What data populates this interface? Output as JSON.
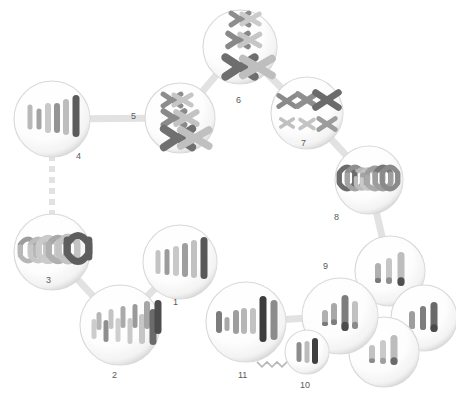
{
  "diagram": {
    "background_color": "#ffffff",
    "cell_fill": "#fbfbfb",
    "cell_edge_color": "#d8d8d8",
    "label_color": "#5a5a5a",
    "connector_color": "#e2e2e2",
    "chromosome_shades": [
      "#c9c9c9",
      "#b4b4b4",
      "#9e9e9e",
      "#8a8a8a",
      "#6f6f6f",
      "#4f4f4f"
    ]
  },
  "labels": [
    {
      "id": "label-1",
      "text": "1",
      "x": 173,
      "y": 298
    },
    {
      "id": "label-2",
      "text": "2",
      "x": 112,
      "y": 371
    },
    {
      "id": "label-3",
      "text": "3",
      "x": 46,
      "y": 276
    },
    {
      "id": "label-4",
      "text": "4",
      "x": 76,
      "y": 152
    },
    {
      "id": "label-5",
      "text": "5",
      "x": 131,
      "y": 112
    },
    {
      "id": "label-6",
      "text": "6",
      "x": 236,
      "y": 96
    },
    {
      "id": "label-7",
      "text": "7",
      "x": 301,
      "y": 139
    },
    {
      "id": "label-8",
      "text": "8",
      "x": 334,
      "y": 213
    },
    {
      "id": "label-9",
      "text": "9",
      "x": 323,
      "y": 262
    },
    {
      "id": "label-10",
      "text": "10",
      "x": 300,
      "y": 381
    },
    {
      "id": "label-11",
      "text": "11",
      "x": 238,
      "y": 371
    }
  ],
  "cells": [
    {
      "id": "cell-4",
      "name": "cell-4-interphase",
      "label": "4",
      "cx": 52,
      "cy": 119,
      "r": 38,
      "stage": "interphase-chromosomes",
      "chromosomes": [
        {
          "x": -22,
          "y": -2,
          "w": 5,
          "h": 25,
          "shade": "#b9b9b9"
        },
        {
          "x": -13,
          "y": 0,
          "w": 5,
          "h": 21,
          "shade": "#a3a3a3"
        },
        {
          "x": -4,
          "y": -1,
          "w": 6,
          "h": 30,
          "shade": "#c9c9c9"
        },
        {
          "x": 5,
          "y": -1,
          "w": 6,
          "h": 30,
          "shade": "#949494"
        },
        {
          "x": 14,
          "y": -2,
          "w": 6,
          "h": 36,
          "shade": "#bdbdbd"
        },
        {
          "x": 24,
          "y": -3,
          "w": 7,
          "h": 42,
          "shade": "#5b5b5b"
        }
      ]
    },
    {
      "id": "cell-3",
      "name": "cell-3-anaphase",
      "label": "3",
      "cx": 52,
      "cy": 252,
      "r": 38,
      "stage": "anaphase-v-shapes",
      "chromosomes": [
        {
          "x": -24,
          "y": -12,
          "w": 5,
          "h": 13,
          "shade": "#9d9d9d",
          "shape": "arch-up"
        },
        {
          "x": -14,
          "y": -12,
          "w": 5,
          "h": 13,
          "shade": "#bdbdbd",
          "shape": "arch-up"
        },
        {
          "x": -4,
          "y": -13,
          "w": 6,
          "h": 16,
          "shade": "#cacaca",
          "shape": "arch-up"
        },
        {
          "x": 6,
          "y": -13,
          "w": 6,
          "h": 16,
          "shade": "#a8a8a8",
          "shape": "arch-up"
        },
        {
          "x": 16,
          "y": -14,
          "w": 6,
          "h": 18,
          "shade": "#c3c3c3",
          "shape": "arch-up"
        },
        {
          "x": 26,
          "y": -15,
          "w": 7,
          "h": 20,
          "shade": "#5e5e5e",
          "shape": "arch-up"
        },
        {
          "x": -24,
          "y": 8,
          "w": 5,
          "h": 13,
          "shade": "#b7b7b7",
          "shape": "arch-down"
        },
        {
          "x": -14,
          "y": 8,
          "w": 5,
          "h": 13,
          "shade": "#c7c7c7",
          "shape": "arch-down"
        },
        {
          "x": -4,
          "y": 8,
          "w": 6,
          "h": 16,
          "shade": "#cacaca",
          "shape": "arch-down"
        },
        {
          "x": 6,
          "y": 8,
          "w": 6,
          "h": 16,
          "shade": "#b0b0b0",
          "shape": "arch-down"
        },
        {
          "x": 16,
          "y": 8,
          "w": 6,
          "h": 18,
          "shade": "#c3c3c3",
          "shape": "arch-down"
        },
        {
          "x": 26,
          "y": 8,
          "w": 7,
          "h": 20,
          "shade": "#5e5e5e",
          "shape": "arch-down"
        }
      ]
    },
    {
      "id": "cell-2",
      "name": "cell-2-prophase",
      "label": "2",
      "cx": 120,
      "cy": 325,
      "r": 40,
      "stage": "condensing-chromatin",
      "chromosomes": [
        {
          "x": -26,
          "y": 4,
          "w": 5,
          "h": 20,
          "shade": "#cccccc"
        },
        {
          "x": -21,
          "y": -4,
          "w": 5,
          "h": 18,
          "shade": "#b6b6b6"
        },
        {
          "x": -14,
          "y": 6,
          "w": 5,
          "h": 22,
          "shade": "#8f8f8f"
        },
        {
          "x": -9,
          "y": -6,
          "w": 5,
          "h": 20,
          "shade": "#c4c4c4"
        },
        {
          "x": -2,
          "y": 5,
          "w": 5,
          "h": 24,
          "shade": "#cfcfcf"
        },
        {
          "x": 3,
          "y": -8,
          "w": 5,
          "h": 22,
          "shade": "#aaaaaa"
        },
        {
          "x": 10,
          "y": 6,
          "w": 5,
          "h": 26,
          "shade": "#c9c9c9"
        },
        {
          "x": 15,
          "y": -9,
          "w": 5,
          "h": 24,
          "shade": "#9a9a9a"
        },
        {
          "x": 22,
          "y": 4,
          "w": 6,
          "h": 30,
          "shade": "#c6c6c6"
        },
        {
          "x": 27,
          "y": -10,
          "w": 6,
          "h": 28,
          "shade": "#a6a6a6"
        },
        {
          "x": 33,
          "y": 2,
          "w": 7,
          "h": 36,
          "shade": "#6b6b6b"
        },
        {
          "x": 38,
          "y": -8,
          "w": 7,
          "h": 34,
          "shade": "#4d4d4d"
        }
      ]
    },
    {
      "id": "cell-1",
      "name": "cell-1-g1-cell",
      "label": "1",
      "cx": 180,
      "cy": 262,
      "r": 37,
      "stage": "unreplicated-chromosomes",
      "chromosomes": [
        {
          "x": -22,
          "y": 0,
          "w": 5,
          "h": 24,
          "shade": "#c3c3c3"
        },
        {
          "x": -13,
          "y": 0,
          "w": 5,
          "h": 26,
          "shade": "#9b9b9b"
        },
        {
          "x": -4,
          "y": -1,
          "w": 6,
          "h": 30,
          "shade": "#c8c8c8"
        },
        {
          "x": 5,
          "y": -2,
          "w": 6,
          "h": 34,
          "shade": "#9e9e9e"
        },
        {
          "x": 14,
          "y": -3,
          "w": 6,
          "h": 38,
          "shade": "#c1c1c1"
        },
        {
          "x": 24,
          "y": -4,
          "w": 7,
          "h": 42,
          "shade": "#585858"
        }
      ]
    },
    {
      "id": "cell-5",
      "name": "cell-5-prophase-i",
      "label": "5",
      "cx": 180,
      "cy": 118,
      "r": 35,
      "stage": "tetrads-crossing-over",
      "tetrads": [
        {
          "x": -8,
          "y": -18,
          "size": 17,
          "shade_a": "#8d8d8d",
          "shade_b": "#c6c6c6"
        },
        {
          "x": -6,
          "y": 0,
          "size": 20,
          "shade_a": "#8a8a8a",
          "shade_b": "#c3c3c3"
        },
        {
          "x": -2,
          "y": 20,
          "size": 27,
          "shade_a": "#707070",
          "shade_b": "#c0c0c0"
        }
      ]
    },
    {
      "id": "cell-6",
      "name": "cell-6-metaphase-i",
      "label": "6",
      "cx": 240,
      "cy": 47,
      "r": 37,
      "stage": "metaphase-plate-alignment",
      "tetrads": [
        {
          "x": 0,
          "y": -28,
          "size": 17,
          "shade_a": "#8d8d8d",
          "shade_b": "#cbcbcb"
        },
        {
          "x": -2,
          "y": -7,
          "size": 19,
          "shade_a": "#888888",
          "shade_b": "#c6c6c6"
        },
        {
          "x": 0,
          "y": 20,
          "size": 28,
          "shade_a": "#6e6e6e",
          "shade_b": "#bebebe"
        }
      ]
    },
    {
      "id": "cell-7",
      "name": "cell-7-anaphase-i",
      "label": "7",
      "cx": 307,
      "cy": 113,
      "r": 36,
      "stage": "homologs-separating",
      "tetrads": [
        {
          "x": -20,
          "y": -12,
          "size": 16,
          "shade_a": "#8a8a8a",
          "shade_b": "#8a8a8a"
        },
        {
          "x": 0,
          "y": -13,
          "size": 18,
          "shade_a": "#8f8f8f",
          "shade_b": "#8f8f8f"
        },
        {
          "x": 20,
          "y": -13,
          "size": 22,
          "shade_a": "#6b6b6b",
          "shade_b": "#6b6b6b"
        },
        {
          "x": -20,
          "y": 10,
          "size": 12,
          "shade_a": "#c0c0c0",
          "shade_b": "#c0c0c0"
        },
        {
          "x": 0,
          "y": 11,
          "size": 13,
          "shade_a": "#c4c4c4",
          "shade_b": "#c4c4c4"
        },
        {
          "x": 20,
          "y": 11,
          "size": 16,
          "shade_a": "#9c9c9c",
          "shade_b": "#9c9c9c"
        }
      ]
    },
    {
      "id": "cell-8",
      "name": "cell-8-anaphase-ii",
      "label": "8",
      "cx": 369,
      "cy": 180,
      "r": 34,
      "stage": "sister-chromatids-separating",
      "chromosomes": [
        {
          "x": -22,
          "y": -12,
          "w": 5,
          "h": 14,
          "shade": "#6c6c6c",
          "shape": "arch-up"
        },
        {
          "x": -14,
          "y": -12,
          "w": 5,
          "h": 13,
          "shade": "#8f8f8f",
          "shape": "arch-up"
        },
        {
          "x": -7,
          "y": -10,
          "w": 4,
          "h": 10,
          "shade": "#b6b6b6",
          "shape": "arch-up"
        },
        {
          "x": -1,
          "y": -10,
          "w": 4,
          "h": 9,
          "shade": "#c4c4c4",
          "shape": "arch-up"
        },
        {
          "x": 6,
          "y": -11,
          "w": 5,
          "h": 11,
          "shade": "#9d9d9d",
          "shape": "arch-up"
        },
        {
          "x": 14,
          "y": -12,
          "w": 5,
          "h": 14,
          "shade": "#777777",
          "shape": "arch-up"
        },
        {
          "x": 21,
          "y": -12,
          "w": 5,
          "h": 14,
          "shade": "#8a8a8a",
          "shape": "arch-up"
        },
        {
          "x": -22,
          "y": 8,
          "w": 5,
          "h": 14,
          "shade": "#6c6c6c",
          "shape": "arch-down"
        },
        {
          "x": -14,
          "y": 8,
          "w": 5,
          "h": 13,
          "shade": "#a3a3a3",
          "shape": "arch-down"
        },
        {
          "x": -7,
          "y": 8,
          "w": 4,
          "h": 10,
          "shade": "#bcbcbc",
          "shape": "arch-down"
        },
        {
          "x": -1,
          "y": 8,
          "w": 4,
          "h": 9,
          "shade": "#c8c8c8",
          "shape": "arch-down"
        },
        {
          "x": 6,
          "y": 8,
          "w": 5,
          "h": 11,
          "shade": "#a9a9a9",
          "shape": "arch-down"
        },
        {
          "x": 14,
          "y": 8,
          "w": 5,
          "h": 14,
          "shade": "#9d9d9d",
          "shape": "arch-down"
        },
        {
          "x": 21,
          "y": 8,
          "w": 5,
          "h": 14,
          "shade": "#8a8a8a",
          "shape": "arch-down"
        }
      ]
    },
    {
      "id": "cell-9",
      "name": "cell-9-haploid-gamete",
      "label": "9",
      "cx": 390,
      "cy": 271,
      "r": 35,
      "stage": "haploid-cell",
      "chromosomes": [
        {
          "x": -12,
          "y": 2,
          "w": 6,
          "h": 20,
          "shade": "#b0b0b0",
          "tip": "#7a7a7a"
        },
        {
          "x": -1,
          "y": 0,
          "w": 6,
          "h": 26,
          "shade": "#c6c6c6",
          "tip": "#8f8f8f"
        },
        {
          "x": 11,
          "y": -2,
          "w": 7,
          "h": 34,
          "shade": "#bdbdbd",
          "tip": "#4f4f4f"
        }
      ]
    },
    {
      "id": "cell-9b",
      "name": "haploid-gamete-right",
      "label": "",
      "cx": 424,
      "cy": 318,
      "r": 33,
      "stage": "haploid-cell",
      "chromosomes": [
        {
          "x": -12,
          "y": 2,
          "w": 6,
          "h": 18,
          "shade": "#9e9e9e",
          "tip": "#9e9e9e"
        },
        {
          "x": -1,
          "y": 0,
          "w": 6,
          "h": 24,
          "shade": "#7e7e7e",
          "tip": "#7e7e7e"
        },
        {
          "x": 10,
          "y": -1,
          "w": 7,
          "h": 30,
          "shade": "#6a6a6a",
          "tip": "#4a4a4a"
        }
      ]
    },
    {
      "id": "cell-9c",
      "name": "haploid-gamete-bottom",
      "label": "",
      "cx": 384,
      "cy": 352,
      "r": 35,
      "stage": "haploid-cell",
      "chromosomes": [
        {
          "x": -12,
          "y": 2,
          "w": 6,
          "h": 18,
          "shade": "#c2c2c2",
          "tip": "#8d8d8d"
        },
        {
          "x": -1,
          "y": 0,
          "w": 6,
          "h": 24,
          "shade": "#cacaca",
          "tip": "#a0a0a0"
        },
        {
          "x": 10,
          "y": -2,
          "w": 7,
          "h": 30,
          "shade": "#bcbcbc",
          "tip": "#6a6a6a"
        }
      ]
    },
    {
      "id": "cell-9d",
      "name": "haploid-gamete-center",
      "label": "",
      "cx": 340,
      "cy": 316,
      "r": 38,
      "stage": "haploid-cell",
      "chromosomes": [
        {
          "x": -15,
          "y": 2,
          "w": 6,
          "h": 16,
          "shade": "#b0b0b0",
          "tip": "#7a7a7a"
        },
        {
          "x": -6,
          "y": -2,
          "w": 6,
          "h": 22,
          "shade": "#a8a8a8",
          "tip": "#7e7e7e"
        },
        {
          "x": 5,
          "y": -3,
          "w": 7,
          "h": 36,
          "shade": "#7d7d7d",
          "tip": "#4c4c4c"
        },
        {
          "x": 15,
          "y": -1,
          "w": 6,
          "h": 28,
          "shade": "#c1c1c1",
          "tip": "#8b8b8b"
        }
      ]
    },
    {
      "id": "cell-10",
      "name": "cell-10-sperm",
      "label": "10",
      "cx": 307,
      "cy": 352,
      "r": 22,
      "stage": "sperm-with-flagellum",
      "has_flagellum": true,
      "chromosomes": [
        {
          "x": -8,
          "y": 0,
          "w": 5,
          "h": 20,
          "shade": "#8c8c8c"
        },
        {
          "x": 0,
          "y": 0,
          "w": 5,
          "h": 22,
          "shade": "#bcbcbc"
        },
        {
          "x": 8,
          "y": -1,
          "w": 6,
          "h": 26,
          "shade": "#3f3f3f"
        }
      ]
    },
    {
      "id": "cell-11",
      "name": "cell-11-zygote",
      "label": "11",
      "cx": 246,
      "cy": 322,
      "r": 40,
      "stage": "zygote-diploid",
      "chromosomes": [
        {
          "x": -27,
          "y": 0,
          "w": 6,
          "h": 22,
          "shade": "#7c7c7c"
        },
        {
          "x": -19,
          "y": 2,
          "w": 5,
          "h": 14,
          "shade": "#a8a8a8"
        },
        {
          "x": -10,
          "y": 0,
          "w": 6,
          "h": 24,
          "shade": "#9e9e9e"
        },
        {
          "x": -2,
          "y": -1,
          "w": 6,
          "h": 26,
          "shade": "#b6b6b6"
        },
        {
          "x": 7,
          "y": -1,
          "w": 6,
          "h": 26,
          "shade": "#c2c2c2"
        },
        {
          "x": 17,
          "y": -3,
          "w": 7,
          "h": 46,
          "shade": "#3d3d3d"
        },
        {
          "x": 28,
          "y": -2,
          "w": 7,
          "h": 40,
          "shade": "#8c8c8c"
        }
      ]
    }
  ],
  "connectors": [
    {
      "id": "conn-4-3",
      "name": "connector-dashed-4-to-3",
      "style": "dashed",
      "from": "cell-4",
      "to": "cell-3"
    },
    {
      "id": "conn-3-2",
      "name": "arrow-2-to-3",
      "style": "arrow",
      "from": "cell-2",
      "to": "cell-3"
    },
    {
      "id": "conn-2-1",
      "name": "arrow-1-to-2",
      "style": "arrow",
      "from": "cell-1",
      "to": "cell-2"
    },
    {
      "id": "conn-5-4",
      "name": "arrow-5-to-4",
      "style": "arrow",
      "from": "cell-5",
      "to": "cell-4"
    },
    {
      "id": "conn-6-5",
      "name": "arrow-6-to-5",
      "style": "arrow",
      "from": "cell-6",
      "to": "cell-5"
    },
    {
      "id": "conn-7-6",
      "name": "arrow-6-to-7",
      "style": "arrow",
      "from": "cell-6",
      "to": "cell-7"
    },
    {
      "id": "conn-8-7",
      "name": "arrow-7-to-8",
      "style": "arrow",
      "from": "cell-7",
      "to": "cell-8"
    },
    {
      "id": "conn-9-8",
      "name": "arrow-8-to-9",
      "style": "arrow",
      "from": "cell-8",
      "to": "cell-9"
    },
    {
      "id": "conn-11-9",
      "name": "arrow-9-to-11",
      "style": "arrow",
      "from": "cell-9d",
      "to": "cell-11"
    }
  ]
}
